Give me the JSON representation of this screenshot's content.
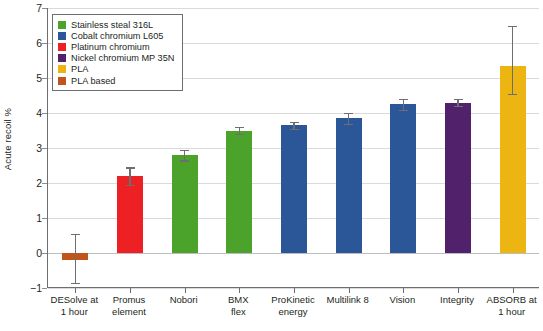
{
  "chart_data": {
    "type": "bar",
    "title": "",
    "xlabel": "",
    "ylabel": "Acute recoil %",
    "ylim": [
      -1,
      7
    ],
    "yticks": [
      -1,
      0,
      1,
      2,
      3,
      4,
      5,
      6,
      7
    ],
    "ytick_labels": [
      "−1",
      "0",
      "1",
      "2",
      "3",
      "4",
      "5",
      "6",
      "7"
    ],
    "grid": true,
    "legend_position": "upper-left",
    "categories": [
      "DESolve at 1 hour",
      "Promus element",
      "Nobori",
      "BMX flex",
      "ProKinetic energy",
      "Multilink 8",
      "Vision",
      "Integrity",
      "ABSORB at 1 hour"
    ],
    "values": [
      -0.2,
      2.2,
      2.8,
      3.5,
      3.65,
      3.85,
      4.25,
      4.3,
      5.35
    ],
    "err_low": [
      -0.85,
      1.95,
      2.65,
      3.4,
      3.55,
      3.7,
      4.1,
      4.2,
      4.55
    ],
    "err_high": [
      0.55,
      2.45,
      2.95,
      3.6,
      3.75,
      4.0,
      4.4,
      4.4,
      6.5
    ],
    "bar_materials": [
      "PLA based",
      "Platinum chromium",
      "Stainless steal 316L",
      "Stainless steal 316L",
      "Cobalt chromium L605",
      "Cobalt chromium L605",
      "Cobalt chromium L605",
      "Nickel chromium MP 35N",
      "PLA"
    ],
    "bar_colors": [
      "#c0541a",
      "#ed2024",
      "#4ba32b",
      "#4ba32b",
      "#2b5697",
      "#2b5697",
      "#2b5697",
      "#52216b",
      "#edb511"
    ]
  },
  "legend": {
    "items": [
      {
        "label": "Stainless steal 316L",
        "color": "#4ba32b"
      },
      {
        "label": "Cobalt chromium L605",
        "color": "#2b5697"
      },
      {
        "label": "Platinum chromium",
        "color": "#ed2024"
      },
      {
        "label": "Nickel chromium MP 35N",
        "color": "#52216b"
      },
      {
        "label": "PLA",
        "color": "#edb511"
      },
      {
        "label": "PLA based",
        "color": "#c0541a"
      }
    ]
  },
  "xtick_labels": [
    [
      "DESolve at",
      "1 hour"
    ],
    [
      "Promus",
      "element"
    ],
    [
      "Nobori",
      ""
    ],
    [
      "BMX",
      "flex"
    ],
    [
      "ProKinetic",
      "energy"
    ],
    [
      "Multilink 8",
      ""
    ],
    [
      "Vision",
      ""
    ],
    [
      "Integrity",
      ""
    ],
    [
      "ABSORB at",
      "1 hour"
    ]
  ]
}
